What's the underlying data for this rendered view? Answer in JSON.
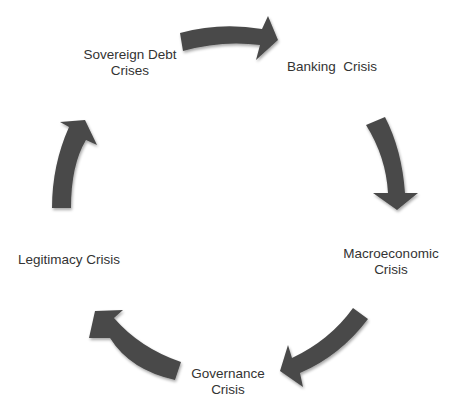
{
  "diagram": {
    "type": "cycle",
    "arrow_color": "#4a4a4a",
    "text_color": "#333333",
    "background": "#ffffff",
    "nodes": [
      {
        "id": "sovereign-debt",
        "lines": [
          "Sovereign Debt",
          "Crises"
        ]
      },
      {
        "id": "banking",
        "lines": [
          "Banking  Crisis"
        ]
      },
      {
        "id": "macroeconomic",
        "lines": [
          "Macroeconomic",
          "Crisis"
        ]
      },
      {
        "id": "governance",
        "lines": [
          "Governance",
          "Crisis"
        ]
      },
      {
        "id": "legitimacy",
        "lines": [
          "Legitimacy Crisis"
        ]
      }
    ],
    "edges": [
      {
        "from": "sovereign-debt",
        "to": "banking"
      },
      {
        "from": "banking",
        "to": "macroeconomic"
      },
      {
        "from": "macroeconomic",
        "to": "governance"
      },
      {
        "from": "governance",
        "to": "legitimacy"
      },
      {
        "from": "legitimacy",
        "to": "sovereign-debt"
      }
    ]
  }
}
